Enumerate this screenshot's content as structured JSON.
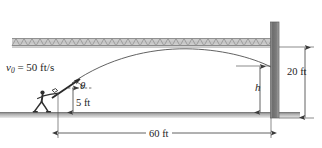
{
  "figure": {
    "labels": {
      "initial_velocity_symbol": "v",
      "initial_velocity_subscript": "0",
      "initial_velocity_equals": " = ",
      "initial_velocity_value": "50 ft/s",
      "angle": "θ",
      "launch_height": "5 ft",
      "impact_height_symbol": "h",
      "wall_height": "20 ft",
      "horizontal_distance": "60 ft"
    },
    "colors": {
      "line": "#4a4a4a",
      "trajectory": "#5a5a5a",
      "ground": "#9a9a9a",
      "ceiling_band": "#bdbdbd",
      "wall": "#7a7a7a",
      "text": "#1d1d1d",
      "background": "#ffffff"
    },
    "geometry": {
      "launch_x": 58,
      "launch_y": 88,
      "ground_y": 113,
      "ceiling_y": 46,
      "wall_x": 271,
      "wall_top_y": 22,
      "apex_x": 186,
      "apex_y": 49,
      "impact_x": 271,
      "impact_y": 67
    },
    "icons": {
      "thrower": "person-throwing-icon",
      "ceiling_hatch": "hatch-pattern-icon",
      "wall": "wall-icon",
      "ground": "ground-icon"
    }
  }
}
